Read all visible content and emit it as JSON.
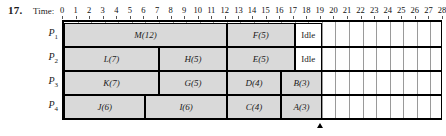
{
  "problem_number": "17.",
  "time_caption": "Time:",
  "axis": {
    "ticks": [
      0,
      1,
      2,
      3,
      4,
      5,
      6,
      7,
      8,
      9,
      10,
      11,
      12,
      13,
      14,
      15,
      16,
      17,
      18,
      19,
      20,
      21,
      22,
      23,
      24,
      25,
      26,
      27,
      28
    ],
    "min": 0,
    "max": 28
  },
  "marker": {
    "at_time": 19,
    "glyph": "up-arrow"
  },
  "chart_data": {
    "type": "bar",
    "title": "",
    "xlabel": "Time:",
    "ylabel": "",
    "xlim": [
      0,
      28
    ],
    "grid": true,
    "categories": [
      "P1",
      "P2",
      "P3",
      "P4"
    ],
    "series": [
      {
        "name": "P1",
        "label": "P",
        "subscript": "1",
        "blocks": [
          {
            "label": "M(12)",
            "task": "M",
            "duration": 12,
            "start": 0,
            "end": 12,
            "idle": false
          },
          {
            "label": "F(5)",
            "task": "F",
            "duration": 5,
            "start": 12,
            "end": 17,
            "idle": false
          },
          {
            "label": "Idle",
            "task": "Idle",
            "duration": 2,
            "start": 17,
            "end": 19,
            "idle": true
          }
        ]
      },
      {
        "name": "P2",
        "label": "P",
        "subscript": "2",
        "blocks": [
          {
            "label": "L(7)",
            "task": "L",
            "duration": 7,
            "start": 0,
            "end": 7,
            "idle": false
          },
          {
            "label": "H(5)",
            "task": "H",
            "duration": 5,
            "start": 7,
            "end": 12,
            "idle": false
          },
          {
            "label": "E(5)",
            "task": "E",
            "duration": 5,
            "start": 12,
            "end": 17,
            "idle": false
          },
          {
            "label": "Idle",
            "task": "Idle",
            "duration": 2,
            "start": 17,
            "end": 19,
            "idle": true
          }
        ]
      },
      {
        "name": "P3",
        "label": "P",
        "subscript": "3",
        "blocks": [
          {
            "label": "K(7)",
            "task": "K",
            "duration": 7,
            "start": 0,
            "end": 7,
            "idle": false
          },
          {
            "label": "G(5)",
            "task": "G",
            "duration": 5,
            "start": 7,
            "end": 12,
            "idle": false
          },
          {
            "label": "D(4)",
            "task": "D",
            "duration": 4,
            "start": 12,
            "end": 16,
            "idle": false
          },
          {
            "label": "B(3)",
            "task": "B",
            "duration": 3,
            "start": 16,
            "end": 19,
            "idle": false
          }
        ]
      },
      {
        "name": "P4",
        "label": "P",
        "subscript": "4",
        "blocks": [
          {
            "label": "J(6)",
            "task": "J",
            "duration": 6,
            "start": 0,
            "end": 6,
            "idle": false
          },
          {
            "label": "I(6)",
            "task": "I",
            "duration": 6,
            "start": 6,
            "end": 12,
            "idle": false
          },
          {
            "label": "C(4)",
            "task": "C",
            "duration": 4,
            "start": 12,
            "end": 16,
            "idle": false
          },
          {
            "label": "A(3)",
            "task": "A",
            "duration": 3,
            "start": 16,
            "end": 19,
            "idle": false
          }
        ]
      }
    ]
  }
}
